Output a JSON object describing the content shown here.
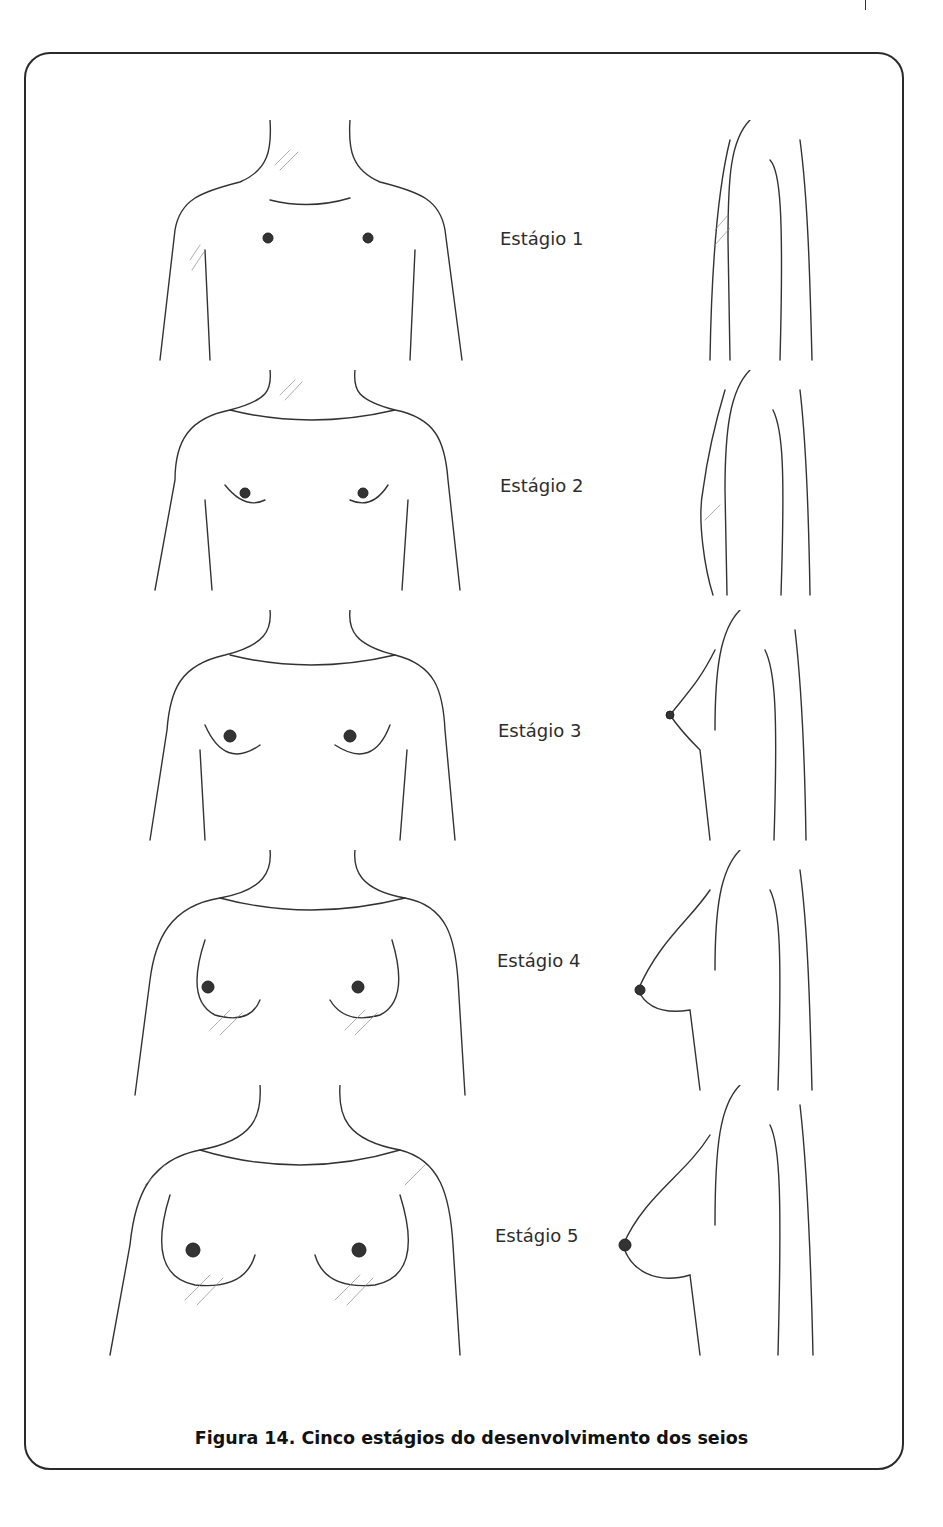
{
  "figure": {
    "caption": "Figura 14. Cinco estágios do desenvolvimento dos seios",
    "stages": [
      {
        "label": "Estágio 1",
        "level": 1
      },
      {
        "label": "Estágio 2",
        "level": 2
      },
      {
        "label": "Estágio 3",
        "level": 3
      },
      {
        "label": "Estágio 4",
        "level": 4
      },
      {
        "label": "Estágio 5",
        "level": 5
      }
    ]
  }
}
